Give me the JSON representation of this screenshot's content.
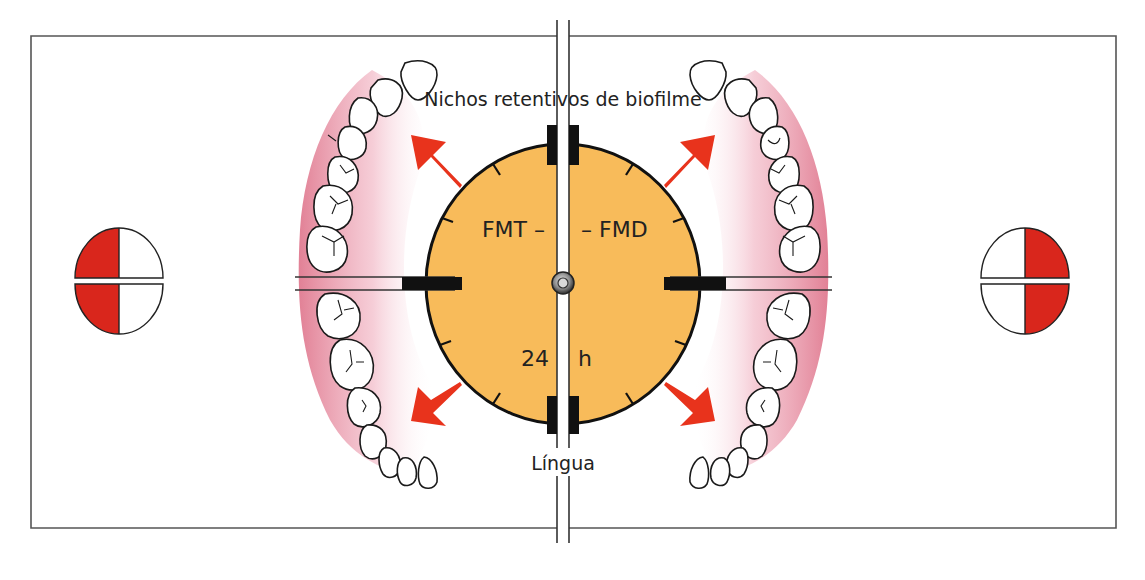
{
  "diagram": {
    "labels": {
      "top": "Nichos retentivos de biofilme",
      "bottom": "Língua",
      "clock_left": "FMT –",
      "clock_right": "– FMD",
      "time_value": "24",
      "time_unit": "h"
    },
    "colors": {
      "clock_fill": "#f8bb5a",
      "arrow": "#e8331c",
      "quadrant_fill": "#d9261c",
      "gum_pink": "#e8899c",
      "outline": "#1a1a1a",
      "frame": "#555555"
    },
    "left_indicator": {
      "filled_quadrants": [
        "upper-left",
        "lower-left"
      ]
    },
    "right_indicator": {
      "filled_quadrants": [
        "upper-right",
        "lower-right"
      ]
    }
  }
}
